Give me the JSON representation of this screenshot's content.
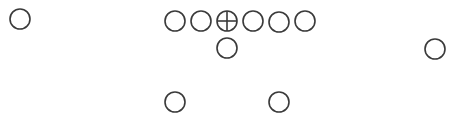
{
  "diagram": {
    "type": "football-formation",
    "stroke_color": "#3a3a3a",
    "background_color": "#ffffff",
    "players": [
      {
        "id": "wide-receiver-left",
        "role": "WR",
        "symbol": "circle"
      },
      {
        "id": "left-tackle",
        "role": "LT",
        "symbol": "circle"
      },
      {
        "id": "left-guard",
        "role": "LG",
        "symbol": "circle"
      },
      {
        "id": "center",
        "role": "C",
        "symbol": "circle-cross"
      },
      {
        "id": "right-guard",
        "role": "RG",
        "symbol": "circle"
      },
      {
        "id": "right-tackle",
        "role": "RT",
        "symbol": "circle"
      },
      {
        "id": "tight-end",
        "role": "TE",
        "symbol": "circle"
      },
      {
        "id": "quarterback",
        "role": "QB",
        "symbol": "circle"
      },
      {
        "id": "wide-receiver-right",
        "role": "WR",
        "symbol": "circle"
      },
      {
        "id": "halfback-left",
        "role": "HB",
        "symbol": "circle"
      },
      {
        "id": "halfback-right",
        "role": "HB",
        "symbol": "circle"
      }
    ]
  }
}
